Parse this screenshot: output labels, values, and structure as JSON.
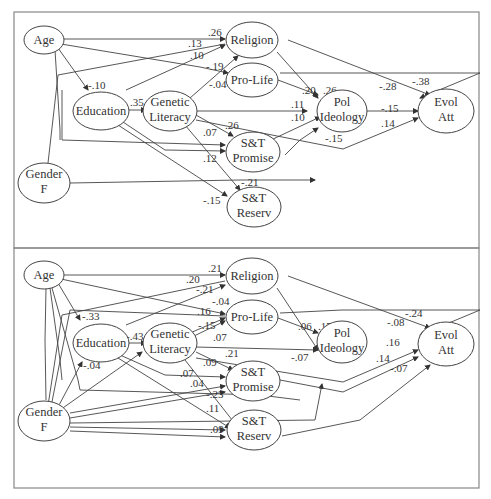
{
  "panels": [
    {
      "name": "top",
      "nodes": {
        "age": [
          "Age"
        ],
        "education": [
          "Education"
        ],
        "gender": [
          "Gender",
          "F"
        ],
        "genlit": [
          "Genetic",
          "Literacy"
        ],
        "religion": [
          "Religion"
        ],
        "prolife": [
          "Pro-Life"
        ],
        "polideo": [
          "Pol",
          "Ideology"
        ],
        "stpromise": [
          "S&T",
          "Promise"
        ],
        "streserv": [
          "S&T",
          "Reserv"
        ],
        "evolatt": [
          "Evol",
          "Att"
        ]
      },
      "coefficients": {
        "age_religion": ".26",
        "a_13": ".13",
        "a_10": ".10",
        "a_m19": "-.19",
        "a_m04": "-.04",
        "age_education": "-.10",
        "edu_genlit": ".35",
        "prolife_pol": ".20",
        "religion_pol": ".26",
        "genlit_pol": ".11",
        "stp_pol": ".10",
        "genlit_stp": ".26",
        "edu_stp": ".07",
        "genlit_str": ".12",
        "gender_str": "-.21",
        "edu_str": "-.15",
        "religion_evol": "-.38",
        "prolife_evol": "-.28",
        "pol_evol": "-.15",
        "stp_evol": ".14",
        "genlit_evol": "-.15"
      }
    },
    {
      "name": "bottom",
      "nodes": {
        "age": [
          "Age"
        ],
        "education": [
          "Education"
        ],
        "gender": [
          "Gender",
          "F"
        ],
        "genlit": [
          "Genetic",
          "Literacy"
        ],
        "religion": [
          "Religion"
        ],
        "prolife": [
          "Pro-Life"
        ],
        "polideo": [
          "Pol",
          "Ideology"
        ],
        "stpromise": [
          "S&T",
          "Promise"
        ],
        "streserv": [
          "S&T",
          "Reserv"
        ],
        "evolatt": [
          "Evol",
          "Att"
        ]
      },
      "coefficients": {
        "age_religion": ".21",
        "b_20": ".20",
        "b_m21": "-.21",
        "b_m04": "-.04",
        "b_16": ".16",
        "b_m15": "-.15",
        "b_07a": ".07",
        "age_education": "-.33",
        "edu_genlit": "-.43",
        "gender_education": "-.04",
        "prolife_pol": ".06",
        "religion_pol": ".17",
        "genlit_pol": "-.07",
        "genlit_stp": ".21",
        "b_09": ".09",
        "b_07b": ".07",
        "b_04": ".04",
        "b_m23": "-.23",
        "b_m12": "-.12",
        "b_11": ".11",
        "b_09b": ".09",
        "religion_evol": "-.24",
        "prolife_evol": "-.08",
        "b_16e": ".16",
        "b_14e": ".14",
        "str_evol": "-.07"
      }
    }
  ]
}
